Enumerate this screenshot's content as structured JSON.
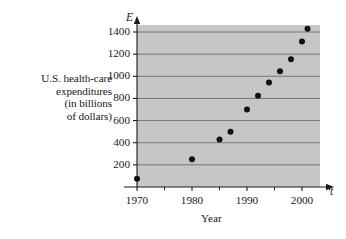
{
  "figure": {
    "background_color": "#ffffff",
    "plot_background_color": "#c6c6c6",
    "gridline_color": "#6e6e6e",
    "axis_color": "#1a1a1a",
    "marker_color": "#111111"
  },
  "axis_labels": {
    "y_symbol": "E",
    "x_symbol": "t",
    "x_title": "Year",
    "y_title_lines": [
      "U.S. health-care",
      "expenditures",
      "(in billions",
      "of dollars)"
    ]
  },
  "chart_data": {
    "type": "scatter",
    "title": "",
    "xlabel": "Year",
    "ylabel": "U.S. health-care expenditures (in billions of dollars)",
    "x": [
      1970,
      1980,
      1985,
      1987,
      1990,
      1992,
      1994,
      1996,
      1998,
      2000,
      2001
    ],
    "values": [
      75,
      250,
      430,
      500,
      700,
      825,
      945,
      1045,
      1155,
      1315,
      1430
    ],
    "xlim": [
      1966,
      2007
    ],
    "ylim": [
      0,
      1500
    ],
    "xticks": [
      1970,
      1980,
      1990,
      2000
    ],
    "xtick_labels": [
      "1970",
      "1980",
      "1990",
      "2000"
    ],
    "xticks_minor": [
      1975,
      1985,
      1995,
      2005
    ],
    "yticks": [
      200,
      400,
      600,
      800,
      1000,
      1200,
      1400
    ],
    "ytick_labels": [
      "200",
      "400",
      "600",
      "800",
      "1000",
      "1200",
      "1400"
    ],
    "grid": "horizontal",
    "legend": "none",
    "marker": "filled-circle"
  }
}
